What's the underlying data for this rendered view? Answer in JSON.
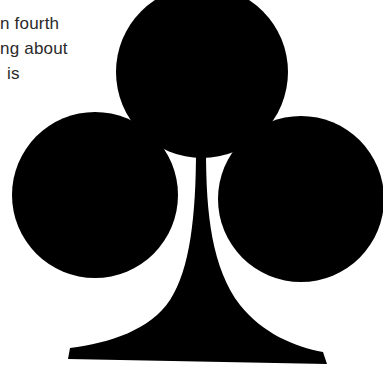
{
  "text": {
    "lines": [
      "n fourth",
      "ng about",
      "is"
    ]
  },
  "graphic": {
    "icon": "club-suit-icon",
    "fill": "#000000",
    "background": "#ffffff"
  }
}
